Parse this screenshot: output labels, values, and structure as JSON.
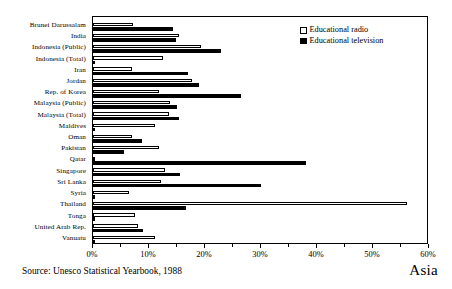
{
  "chart_data": {
    "type": "bar",
    "orientation": "horizontal",
    "title": "",
    "subtitle": "",
    "region_label": "Asia",
    "xlabel": "",
    "ylabel": "",
    "xlim": [
      0,
      60
    ],
    "xunit": "%",
    "grid": false,
    "legend_position": "top-right",
    "tick_labels": [
      "0%",
      "10%",
      "20%",
      "30%",
      "40%",
      "50%",
      "60%"
    ],
    "tick_values": [
      0,
      10,
      20,
      30,
      40,
      50,
      60
    ],
    "minor_tick_values": [
      5,
      15,
      25,
      35,
      45,
      55
    ],
    "categories": [
      "Brunei Darussalam",
      "India",
      "Indonesia (Public)",
      "Indonesia (Total)",
      "Iran",
      "Jordan",
      "Rep. of Korea",
      "Malaysia (Public)",
      "Malaysia (Total)",
      "Maldives",
      "Oman",
      "Pakistan",
      "Qatar",
      "Singapore",
      "Sri Lanka",
      "Syria",
      "Thailand",
      "Tonga",
      "United Arab Rep.",
      "Vanuatu"
    ],
    "series": [
      {
        "name": "Educational radio",
        "color": "#ffffff",
        "values": [
          7.2,
          15.3,
          19.3,
          12.5,
          7.0,
          17.6,
          11.8,
          13.7,
          13.5,
          11.0,
          7.0,
          11.8,
          0.3,
          12.8,
          12.2,
          6.5,
          56.0,
          7.5,
          8.0,
          11.0
        ]
      },
      {
        "name": "Educational television",
        "color": "#000000",
        "values": [
          14.3,
          14.8,
          22.9,
          0.3,
          17.0,
          19.0,
          26.5,
          15.0,
          15.3,
          0.3,
          8.8,
          5.5,
          38.0,
          15.5,
          30.0,
          0.3,
          16.6,
          0.3,
          9.0,
          0.3
        ]
      }
    ]
  },
  "legend": {
    "items": [
      {
        "label": "Educational radio",
        "style": "radio"
      },
      {
        "label": "Educational television",
        "style": "tv"
      }
    ]
  },
  "source": {
    "text": "Source: Unesco Statistical Yearbook, 1988"
  }
}
